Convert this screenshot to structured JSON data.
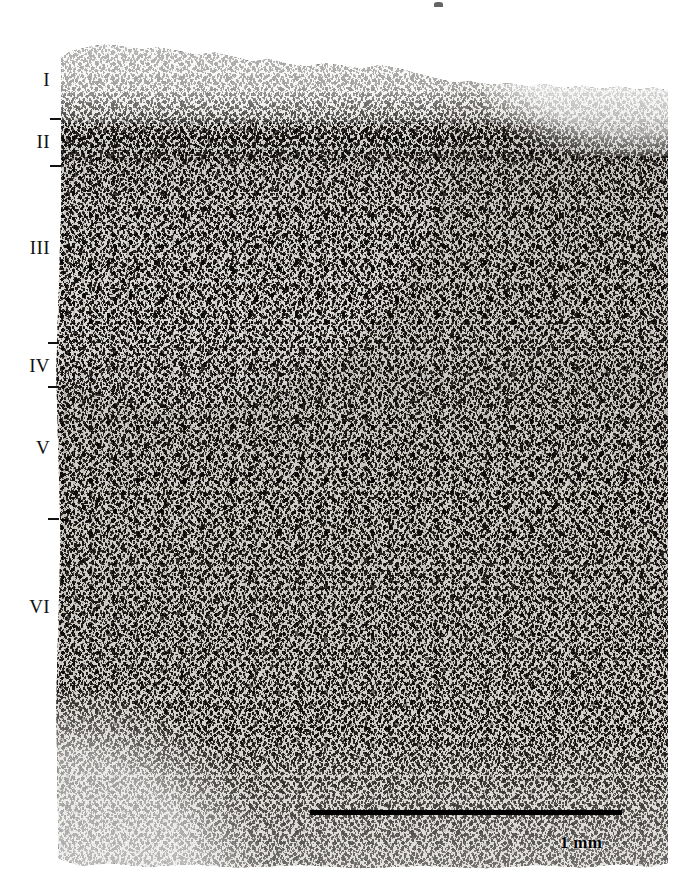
{
  "figure": {
    "kind": "nissl-stained-cortex-micrograph",
    "stain_tone_hex": "#1a1715",
    "background_hex": "#ffffff",
    "tissue_tone_hex": "#f2f0ec"
  },
  "layer_labels": [
    {
      "name": "layer-label-i",
      "text": "I",
      "top": 70,
      "left": 2
    },
    {
      "name": "layer-label-ii",
      "text": "II",
      "top": 132,
      "left": 2
    },
    {
      "name": "layer-label-iii",
      "text": "III",
      "top": 238,
      "left": 2
    },
    {
      "name": "layer-label-iv",
      "text": "IV",
      "top": 356,
      "left": 2
    },
    {
      "name": "layer-label-v",
      "text": "V",
      "top": 438,
      "left": 2
    },
    {
      "name": "layer-label-vi",
      "text": "VI",
      "top": 597,
      "left": 2
    }
  ],
  "layer_ticks": [
    {
      "name": "layer-tick-i-ii",
      "top": 118,
      "left": 50
    },
    {
      "name": "layer-tick-ii-iii",
      "top": 165,
      "left": 50
    },
    {
      "name": "layer-tick-iii-iv",
      "top": 342,
      "left": 48
    },
    {
      "name": "layer-tick-iv-v",
      "top": 386,
      "left": 48
    },
    {
      "name": "layer-tick-v-vi",
      "top": 518,
      "left": 48
    }
  ],
  "scale": {
    "label": "1 mm",
    "bar_left": 310,
    "bar_top": 810,
    "bar_width": 312,
    "bar_height": 5,
    "label_left": 560,
    "label_top": 833,
    "color_hex": "#000000"
  },
  "chart_data": {
    "type": "heatmap",
    "title": "",
    "xlabel": "",
    "ylabel": "Cortical depth",
    "categories": [
      "I",
      "II",
      "III",
      "IV",
      "V",
      "VI"
    ],
    "series": [
      {
        "name": "relative cell packing density (0-1, estimated from stain darkness)",
        "values": [
          0.12,
          0.92,
          0.72,
          0.8,
          0.62,
          0.55
        ]
      }
    ],
    "annotations": [
      "1 mm"
    ],
    "grid": false,
    "legend": "none"
  }
}
